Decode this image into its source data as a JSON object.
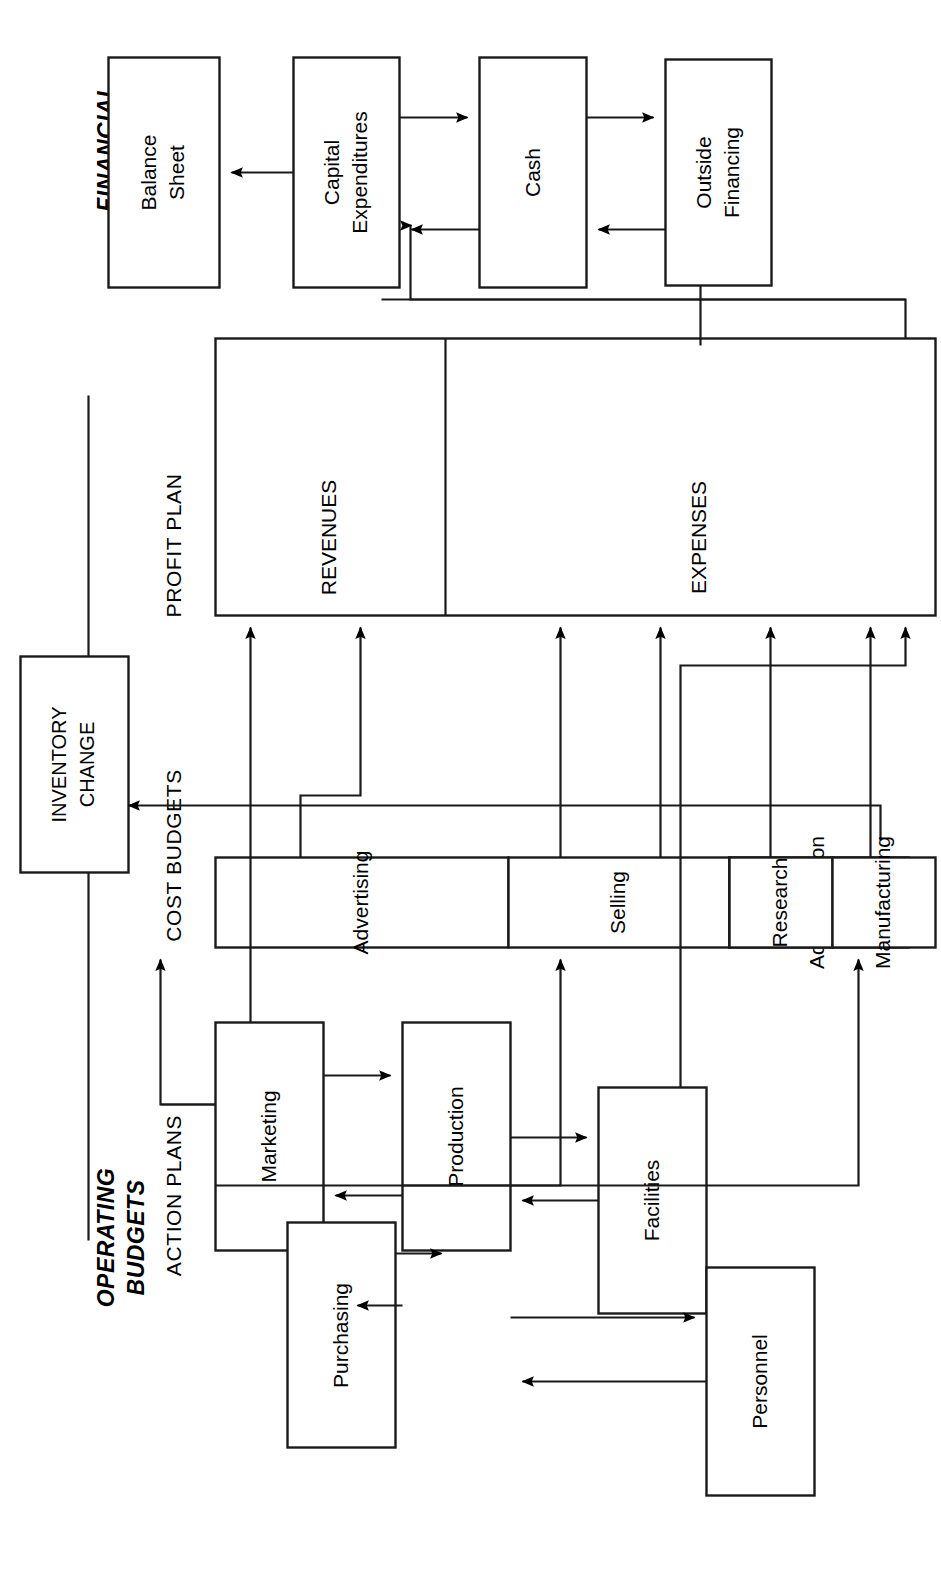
{
  "diagram": {
    "group_labels": {
      "operating": "OPERATING\nBUDGETS",
      "operating_line1": "OPERATING",
      "operating_line2": "BUDGETS",
      "financial_line1": "FINANCIAL",
      "financial_line2": "BUDGETS"
    },
    "sections": [
      {
        "id": "action-plans",
        "label": "ACTION PLANS"
      },
      {
        "id": "cost-budgets",
        "label": "COST BUDGETS"
      },
      {
        "id": "profit-plan",
        "label": "PROFIT PLAN"
      },
      {
        "id": "financial",
        "label": "FINANCIAL BUDGETS"
      }
    ],
    "nodes": {
      "marketing": {
        "label": "Marketing",
        "group": "action-plans"
      },
      "production": {
        "label": "Production",
        "group": "action-plans"
      },
      "facilities": {
        "label": "Facilities",
        "group": "action-plans"
      },
      "personnel": {
        "label": "Personnel",
        "group": "action-plans"
      },
      "purchasing": {
        "label": "Purchasing",
        "group": "action-plans"
      },
      "advertising": {
        "label": "Advertising",
        "group": "cost-budgets"
      },
      "selling": {
        "label": "Selling",
        "group": "cost-budgets"
      },
      "administration": {
        "label": "Administration",
        "group": "cost-budgets"
      },
      "research": {
        "label": "Research",
        "group": "cost-budgets"
      },
      "manufacturing": {
        "label": "Manufacturing",
        "group": "cost-budgets"
      },
      "revenues": {
        "label": "REVENUES",
        "group": "profit-plan"
      },
      "expenses": {
        "label": "EXPENSES",
        "group": "profit-plan"
      },
      "inventory_change_l1": {
        "label": "INVENTORY",
        "group": "cost-budgets"
      },
      "inventory_change_l2": {
        "label": "CHANGE",
        "group": "cost-budgets"
      },
      "outside_financing_l1": {
        "label": "Outside",
        "group": "financial"
      },
      "outside_financing_l2": {
        "label": "Financing",
        "group": "financial"
      },
      "cash": {
        "label": "Cash",
        "group": "financial"
      },
      "capital_expenditures_l1": {
        "label": "Capital",
        "group": "financial"
      },
      "capital_expenditures_l2": {
        "label": "Expenditures",
        "group": "financial"
      },
      "balance_sheet_l1": {
        "label": "Balance",
        "group": "financial"
      },
      "balance_sheet_l2": {
        "label": "Sheet",
        "group": "financial"
      }
    },
    "edges": [
      {
        "from": "marketing",
        "to": "production",
        "type": "arrow"
      },
      {
        "from": "production",
        "to": "marketing",
        "type": "arrow"
      },
      {
        "from": "facilities",
        "to": "production",
        "type": "arrow"
      },
      {
        "from": "production",
        "to": "facilities",
        "type": "arrow"
      },
      {
        "from": "personnel",
        "to": "production",
        "type": "arrow"
      },
      {
        "from": "production",
        "to": "personnel",
        "type": "arrow"
      },
      {
        "from": "purchasing",
        "to": "production",
        "type": "arrow"
      },
      {
        "from": "production",
        "to": "purchasing",
        "type": "arrow"
      },
      {
        "from": "marketing",
        "to": "advertising",
        "type": "arrow"
      },
      {
        "from": "marketing",
        "to": "selling",
        "type": "arrow"
      },
      {
        "from": "production",
        "to": "manufacturing",
        "type": "arrow"
      },
      {
        "from": "marketing",
        "to": "revenues",
        "type": "arrow"
      },
      {
        "from": "advertising",
        "to": "expenses",
        "type": "arrow"
      },
      {
        "from": "selling",
        "to": "expenses",
        "type": "arrow"
      },
      {
        "from": "administration",
        "to": "expenses",
        "type": "arrow"
      },
      {
        "from": "research",
        "to": "expenses",
        "type": "arrow"
      },
      {
        "from": "manufacturing",
        "to": "expenses",
        "type": "arrow"
      },
      {
        "from": "manufacturing",
        "to": "inventory_change",
        "type": "arrow"
      },
      {
        "from": "facilities",
        "to": "expenses",
        "type": "arrow"
      },
      {
        "from": "expenses",
        "to": "capital_expenditures",
        "type": "arrow"
      },
      {
        "from": "outside_financing",
        "to": "cash",
        "type": "arrow"
      },
      {
        "from": "cash",
        "to": "outside_financing",
        "type": "arrow"
      },
      {
        "from": "cash",
        "to": "capital_expenditures",
        "type": "arrow"
      },
      {
        "from": "capital_expenditures",
        "to": "cash",
        "type": "arrow"
      },
      {
        "from": "capital_expenditures",
        "to": "balance_sheet",
        "type": "arrow"
      }
    ],
    "colors": {
      "stroke": "#1a1a1a",
      "fill": "#ffffff",
      "background": "#ffffff",
      "text": "#000000"
    }
  }
}
